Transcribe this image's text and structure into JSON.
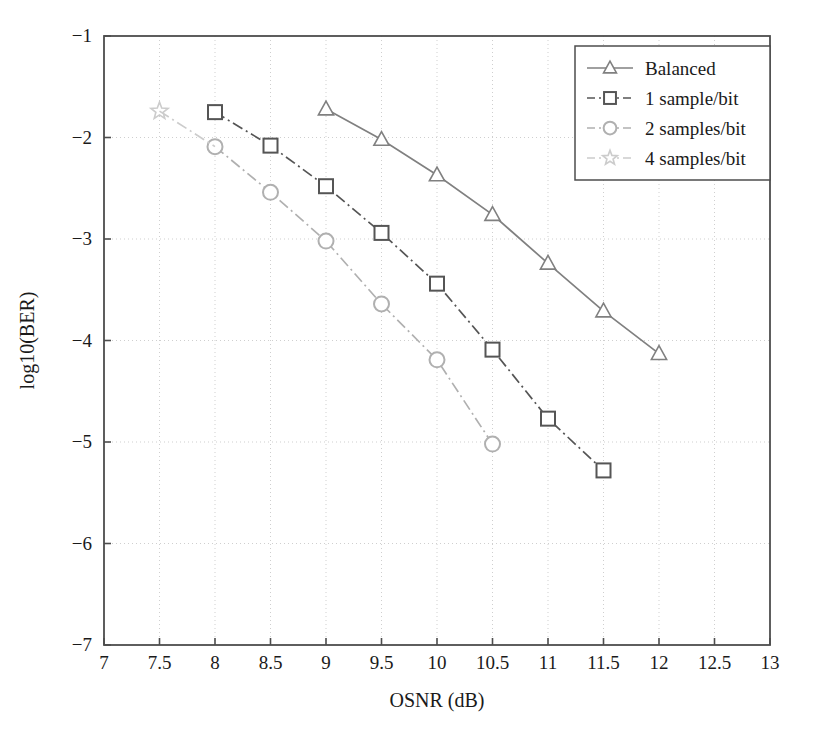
{
  "chart_data": {
    "type": "line",
    "title": "",
    "xlabel": "OSNR (dB)",
    "ylabel": "log10(BER)",
    "xlim": [
      7,
      13
    ],
    "ylim": [
      -7,
      -1
    ],
    "xticks": [
      "7",
      "7.5",
      "8",
      "8.5",
      "9",
      "9.5",
      "10",
      "10.5",
      "11",
      "11.5",
      "12",
      "12.5",
      "13"
    ],
    "xtick_values": [
      7,
      7.5,
      8,
      8.5,
      9,
      9.5,
      10,
      10.5,
      11,
      11.5,
      12,
      12.5,
      13
    ],
    "yticks": [
      "−1",
      "−2",
      "−3",
      "−4",
      "−5",
      "−6",
      "−7"
    ],
    "ytick_values": [
      -1,
      -2,
      -3,
      -4,
      -5,
      -6,
      -7
    ],
    "grid": true,
    "legend_position": "top-right",
    "series": [
      {
        "name": "Balanced",
        "marker": "triangle",
        "linestyle": "solid",
        "color": "#808080",
        "x": [
          9,
          9.5,
          10,
          10.5,
          11,
          11.5,
          12
        ],
        "y": [
          -1.72,
          -2.02,
          -2.37,
          -2.76,
          -3.24,
          -3.71,
          -4.13
        ]
      },
      {
        "name": "1 sample/bit",
        "marker": "square",
        "linestyle": "dashdot",
        "color": "#555555",
        "x": [
          8,
          8.5,
          9,
          9.5,
          10,
          10.5,
          11,
          11.5
        ],
        "y": [
          -1.75,
          -2.08,
          -2.48,
          -2.94,
          -3.44,
          -4.09,
          -4.77,
          -5.28
        ]
      },
      {
        "name": "2 samples/bit",
        "marker": "circle",
        "linestyle": "dashdot",
        "color": "#b0b0b0",
        "x": [
          8,
          8.5,
          9,
          9.5,
          10,
          10.5
        ],
        "y": [
          -2.09,
          -2.54,
          -3.02,
          -3.64,
          -4.19,
          -5.02
        ]
      },
      {
        "name": "4 samples/bit",
        "marker": "star",
        "linestyle": "dashdot",
        "color": "#cccccc",
        "x": [
          7.5
        ],
        "y": [
          -1.74
        ]
      }
    ]
  },
  "legend": {
    "entries": [
      {
        "label": "Balanced"
      },
      {
        "label": "1 sample/bit"
      },
      {
        "label": "2 samples/bit"
      },
      {
        "label": "4 samples/bit"
      }
    ]
  },
  "axes": {
    "frame_color": "#4d4d4d",
    "grid_color": "#cfcfcf",
    "background": "#ffffff"
  }
}
